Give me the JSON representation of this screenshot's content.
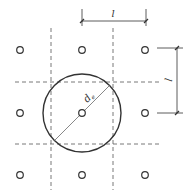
{
  "diagram": {
    "labels": {
      "spacing_top": "l",
      "spacing_right": "l",
      "diameter": "d",
      "diameter_sub": "e"
    },
    "grid": {
      "columns_x": [
        20,
        82,
        145
      ],
      "rows_y": [
        50,
        113,
        175
      ]
    },
    "colors": {
      "stroke": "#333333",
      "dash": "#555555"
    }
  }
}
